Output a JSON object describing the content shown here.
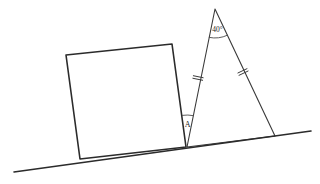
{
  "figure": {
    "kind": "geometry-diagram",
    "width": 320,
    "height": 184,
    "background_color": "#ffffff"
  },
  "colors": {
    "square_fill": "#b9b9b9",
    "square_stroke": "#2b2b2b",
    "triangle_stroke": "#3a3a3a",
    "ground_stroke": "#2b2b2b",
    "label_color": "#1e1e1e",
    "tick_color": "#3a3a3a"
  },
  "ground_line": {
    "name": "inclined ground line",
    "start": {
      "x": 14,
      "y": 172
    },
    "end": {
      "x": 311,
      "y": 131
    }
  },
  "square": {
    "name": "tilted shaded square",
    "fill": "#b9b9b9",
    "points": [
      {
        "x": 66,
        "y": 55
      },
      {
        "x": 172,
        "y": 44
      },
      {
        "x": 186,
        "y": 147
      },
      {
        "x": 80,
        "y": 159
      }
    ]
  },
  "triangle": {
    "name": "isosceles triangle",
    "apex": {
      "x": 215,
      "y": 9
    },
    "left_base": {
      "x": 187,
      "y": 147
    },
    "right_base": {
      "x": 275,
      "y": 136
    },
    "congruent_legs": true,
    "tick_marks_per_leg": 2
  },
  "labels": {
    "apex_angle": "40°",
    "base_angle": "A"
  },
  "annotations": {
    "apex_arc": {
      "name": "apex angle arc",
      "center": {
        "x": 215,
        "y": 9
      },
      "radius": 29
    },
    "base_arc": {
      "name": "angle A arc",
      "center": {
        "x": 187,
        "y": 147
      },
      "radius": 32
    },
    "left_leg_tick": {
      "x": 198,
      "y": 78
    },
    "right_leg_tick": {
      "x": 243,
      "y": 72
    }
  }
}
